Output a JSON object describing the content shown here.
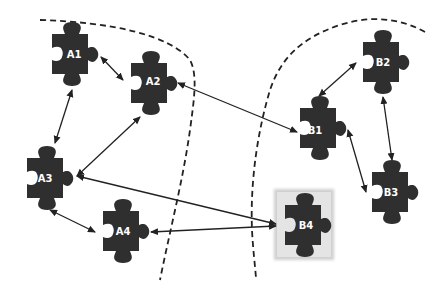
{
  "diagram": {
    "type": "puzzle-piece dependency diagram",
    "colors": {
      "piece": "#2f2f2f",
      "label": "#ffffff",
      "arrow": "#222222",
      "boundary": "#222222",
      "highlight_box": "#d9d9d9"
    },
    "groups": [
      {
        "id": "A",
        "pieces": [
          "A1",
          "A2",
          "A3",
          "A4"
        ]
      },
      {
        "id": "B",
        "pieces": [
          "B1",
          "B2",
          "B3",
          "B4"
        ]
      }
    ],
    "pieces": {
      "A1": {
        "label": "A1",
        "x": 72,
        "y": 54,
        "highlighted": false
      },
      "A2": {
        "label": "A2",
        "x": 151,
        "y": 83,
        "highlighted": false
      },
      "A3": {
        "label": "A3",
        "x": 47,
        "y": 178,
        "highlighted": false
      },
      "A4": {
        "label": "A4",
        "x": 123,
        "y": 231,
        "highlighted": false
      },
      "B1": {
        "label": "B1",
        "x": 320,
        "y": 128,
        "highlighted": false
      },
      "B2": {
        "label": "B2",
        "x": 383,
        "y": 62,
        "highlighted": false
      },
      "B3": {
        "label": "B3",
        "x": 392,
        "y": 192,
        "highlighted": false
      },
      "B4": {
        "label": "B4",
        "x": 305,
        "y": 225,
        "highlighted": true
      }
    },
    "edges": [
      {
        "from": "A1",
        "to": "A2",
        "direction": "both"
      },
      {
        "from": "A1",
        "to": "A3",
        "direction": "both"
      },
      {
        "from": "A2",
        "to": "A3",
        "direction": "both"
      },
      {
        "from": "A3",
        "to": "A4",
        "direction": "both"
      },
      {
        "from": "A2",
        "to": "B1",
        "direction": "both"
      },
      {
        "from": "B1",
        "to": "B2",
        "direction": "both"
      },
      {
        "from": "B1",
        "to": "B3",
        "direction": "both"
      },
      {
        "from": "B2",
        "to": "B3",
        "direction": "both"
      },
      {
        "from": "B4",
        "to": "A3",
        "direction": "both"
      },
      {
        "from": "B4",
        "to": "A4",
        "direction": "both"
      }
    ]
  }
}
